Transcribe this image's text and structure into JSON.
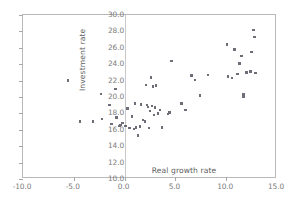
{
  "chart_data": {
    "type": "scatter",
    "title": "",
    "xlabel": "Real growth rate",
    "ylabel": "Investment rate",
    "xlim": [
      -10.0,
      15.0
    ],
    "ylim": [
      10.0,
      30.0
    ],
    "xticks": [
      "-10.0",
      "-5.0",
      "0.0",
      "5.0",
      "10.0",
      "15.0"
    ],
    "xtick_values": [
      -10.0,
      -5.0,
      0.0,
      5.0,
      10.0,
      15.0
    ],
    "yticks": [
      "10.0",
      "12.0",
      "14.0",
      "16.0",
      "18.0",
      "20.0",
      "22.0",
      "24.0",
      "26.0",
      "28.0",
      "30.0"
    ],
    "ytick_values": [
      10.0,
      12.0,
      14.0,
      16.0,
      18.0,
      20.0,
      22.0,
      24.0,
      26.0,
      28.0,
      30.0
    ],
    "grid": false,
    "legend": false,
    "marker_color": "#6e6e78",
    "frame_color": "#b9b9b9",
    "points": [
      [
        -5.6,
        22.0
      ],
      [
        -4.4,
        17.0
      ],
      [
        -3.1,
        17.0
      ],
      [
        -2.3,
        20.4
      ],
      [
        -2.2,
        17.3
      ],
      [
        -1.5,
        19.0
      ],
      [
        -1.3,
        16.7
      ],
      [
        -0.9,
        21.0
      ],
      [
        -0.8,
        17.5
      ],
      [
        -0.5,
        16.5
      ],
      [
        -0.4,
        16.6
      ],
      [
        -0.2,
        16.8
      ],
      [
        0.1,
        16.5
      ],
      [
        0.3,
        18.6
      ],
      [
        0.5,
        16.2
      ],
      [
        0.7,
        17.6
      ],
      [
        0.9,
        16.1
      ],
      [
        1.0,
        19.2
      ],
      [
        1.1,
        16.3
      ],
      [
        1.3,
        15.3
      ],
      [
        1.5,
        16.4
      ],
      [
        1.6,
        19.1
      ],
      [
        1.8,
        17.2
      ],
      [
        2.0,
        17.0
      ],
      [
        2.1,
        21.5
      ],
      [
        2.2,
        19.0
      ],
      [
        2.3,
        18.8
      ],
      [
        2.4,
        16.2
      ],
      [
        2.5,
        18.3
      ],
      [
        2.6,
        22.4
      ],
      [
        2.7,
        18.9
      ],
      [
        2.8,
        21.3
      ],
      [
        2.9,
        17.8
      ],
      [
        3.0,
        18.7
      ],
      [
        3.1,
        21.4
      ],
      [
        3.3,
        18.0
      ],
      [
        3.5,
        18.4
      ],
      [
        3.7,
        16.3
      ],
      [
        4.3,
        17.9
      ],
      [
        4.4,
        18.1
      ],
      [
        4.6,
        24.4
      ],
      [
        5.6,
        19.2
      ],
      [
        6.0,
        18.4
      ],
      [
        6.6,
        22.6
      ],
      [
        6.9,
        22.1
      ],
      [
        7.4,
        20.2
      ],
      [
        8.2,
        22.7
      ],
      [
        10.1,
        26.4
      ],
      [
        10.2,
        22.5
      ],
      [
        10.6,
        22.3
      ],
      [
        10.8,
        25.8
      ],
      [
        11.1,
        22.8
      ],
      [
        11.3,
        24.1
      ],
      [
        11.5,
        25.0
      ],
      [
        11.7,
        20.3
      ],
      [
        11.7,
        20.0
      ],
      [
        12.0,
        23.0
      ],
      [
        12.4,
        23.1
      ],
      [
        12.5,
        25.5
      ],
      [
        12.7,
        28.2
      ],
      [
        12.8,
        27.3
      ],
      [
        12.9,
        22.9
      ]
    ]
  }
}
